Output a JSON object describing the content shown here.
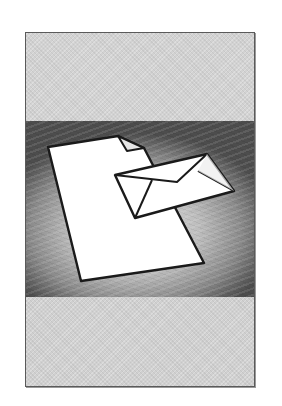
{
  "image": {
    "kind": "clipart-illustration",
    "subject": "document-and-envelope",
    "elements": [
      {
        "name": "document-icon",
        "description": "blank sheet of paper with folded top-right corner"
      },
      {
        "name": "envelope-icon",
        "description": "closed envelope overlapping the document"
      }
    ]
  },
  "colors": {
    "frame_border": "#5a5a5a",
    "band_light": "#d2d2d2",
    "band_dark": "#4d4d4d",
    "paper": "#ffffff",
    "outline": "#1a1a1a"
  }
}
